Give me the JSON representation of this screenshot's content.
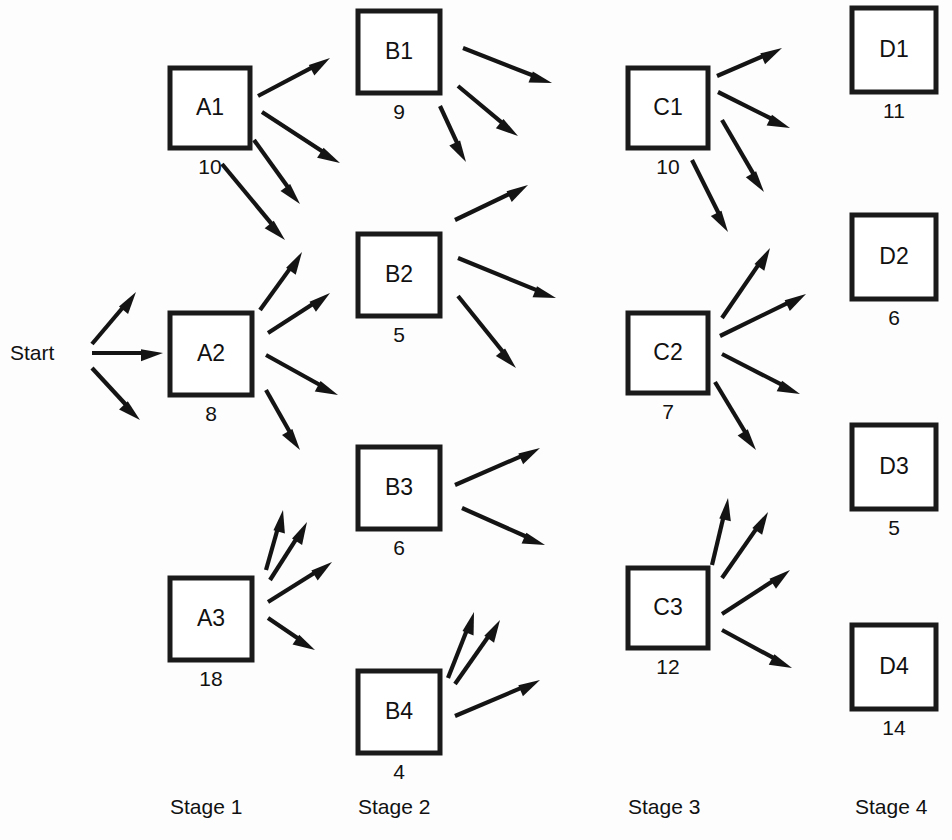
{
  "diagram": {
    "start_label": "Start",
    "stages": [
      {
        "id": "stage1",
        "label": "Stage 1",
        "label_x": 170,
        "label_y": 814
      },
      {
        "id": "stage2",
        "label": "Stage 2",
        "label_x": 358,
        "label_y": 814
      },
      {
        "id": "stage3",
        "label": "Stage 3",
        "label_x": 628,
        "label_y": 814
      },
      {
        "id": "stage4",
        "label": "Stage 4",
        "label_x": 855,
        "label_y": 814
      }
    ],
    "nodes": [
      {
        "id": "A1",
        "label": "A1",
        "value": "10",
        "stage": "Stage 1",
        "x": 170,
        "y": 68,
        "w": 80,
        "h": 80
      },
      {
        "id": "A2",
        "label": "A2",
        "value": "8",
        "stage": "Stage 1",
        "x": 170,
        "y": 313,
        "w": 82,
        "h": 82
      },
      {
        "id": "A3",
        "label": "A3",
        "value": "18",
        "stage": "Stage 1",
        "x": 170,
        "y": 578,
        "w": 82,
        "h": 82
      },
      {
        "id": "B1",
        "label": "B1",
        "value": "9",
        "stage": "Stage 2",
        "x": 358,
        "y": 11,
        "w": 82,
        "h": 82
      },
      {
        "id": "B2",
        "label": "B2",
        "value": "5",
        "stage": "Stage 2",
        "x": 358,
        "y": 234,
        "w": 82,
        "h": 82
      },
      {
        "id": "B3",
        "label": "B3",
        "value": "6",
        "stage": "Stage 2",
        "x": 358,
        "y": 447,
        "w": 82,
        "h": 82
      },
      {
        "id": "B4",
        "label": "B4",
        "value": "4",
        "stage": "Stage 2",
        "x": 358,
        "y": 671,
        "w": 82,
        "h": 82
      },
      {
        "id": "C1",
        "label": "C1",
        "value": "10",
        "stage": "Stage 3",
        "x": 628,
        "y": 68,
        "w": 80,
        "h": 80
      },
      {
        "id": "C2",
        "label": "C2",
        "value": "7",
        "stage": "Stage 3",
        "x": 628,
        "y": 313,
        "w": 80,
        "h": 80
      },
      {
        "id": "C3",
        "label": "C3",
        "value": "12",
        "stage": "Stage 3",
        "x": 628,
        "y": 568,
        "w": 80,
        "h": 80
      },
      {
        "id": "D1",
        "label": "D1",
        "value": "11",
        "stage": "Stage 4",
        "x": 852,
        "y": 8,
        "w": 84,
        "h": 84
      },
      {
        "id": "D2",
        "label": "D2",
        "value": "6",
        "stage": "Stage 4",
        "x": 852,
        "y": 215,
        "w": 84,
        "h": 84
      },
      {
        "id": "D3",
        "label": "D3",
        "value": "5",
        "stage": "Stage 4",
        "x": 852,
        "y": 425,
        "w": 84,
        "h": 84
      },
      {
        "id": "D4",
        "label": "D4",
        "value": "14",
        "stage": "Stage 4",
        "x": 852,
        "y": 625,
        "w": 84,
        "h": 84
      }
    ],
    "edges": [
      {
        "from": "Start",
        "to": "A1",
        "x1": 92,
        "y1": 344,
        "x2": 136,
        "y2": 292
      },
      {
        "from": "Start",
        "to": "A2",
        "x1": 92,
        "y1": 353,
        "x2": 163,
        "y2": 353
      },
      {
        "from": "Start",
        "to": "A3",
        "x1": 92,
        "y1": 368,
        "x2": 140,
        "y2": 420
      },
      {
        "from": "A1",
        "to": "B1",
        "x1": 258,
        "y1": 96,
        "x2": 330,
        "y2": 58
      },
      {
        "from": "A1",
        "to": "B2",
        "x1": 262,
        "y1": 112,
        "x2": 340,
        "y2": 163
      },
      {
        "from": "A1",
        "to": "B3",
        "x1": 254,
        "y1": 140,
        "x2": 300,
        "y2": 204
      },
      {
        "from": "A1",
        "to": "B4",
        "x1": 222,
        "y1": 164,
        "x2": 285,
        "y2": 240
      },
      {
        "from": "A2",
        "to": "B1",
        "x1": 260,
        "y1": 310,
        "x2": 302,
        "y2": 252
      },
      {
        "from": "A2",
        "to": "B2",
        "x1": 268,
        "y1": 333,
        "x2": 330,
        "y2": 293
      },
      {
        "from": "A2",
        "to": "B3",
        "x1": 266,
        "y1": 355,
        "x2": 338,
        "y2": 395
      },
      {
        "from": "A2",
        "to": "B4",
        "x1": 266,
        "y1": 390,
        "x2": 300,
        "y2": 450
      },
      {
        "from": "A3",
        "to": "B1",
        "x1": 266,
        "y1": 570,
        "x2": 283,
        "y2": 510
      },
      {
        "from": "A3",
        "to": "B2",
        "x1": 270,
        "y1": 580,
        "x2": 307,
        "y2": 522
      },
      {
        "from": "A3",
        "to": "B3",
        "x1": 268,
        "y1": 602,
        "x2": 332,
        "y2": 562
      },
      {
        "from": "A3",
        "to": "B4",
        "x1": 268,
        "y1": 618,
        "x2": 315,
        "y2": 650
      },
      {
        "from": "B1",
        "to": "C1",
        "x1": 463,
        "y1": 48,
        "x2": 552,
        "y2": 83
      },
      {
        "from": "B1",
        "to": "C2",
        "x1": 458,
        "y1": 86,
        "x2": 518,
        "y2": 136
      },
      {
        "from": "B1",
        "to": "C3",
        "x1": 440,
        "y1": 106,
        "x2": 466,
        "y2": 162
      },
      {
        "from": "B2",
        "to": "C1",
        "x1": 455,
        "y1": 220,
        "x2": 528,
        "y2": 185
      },
      {
        "from": "B2",
        "to": "C2",
        "x1": 458,
        "y1": 258,
        "x2": 556,
        "y2": 298
      },
      {
        "from": "B2",
        "to": "C3",
        "x1": 458,
        "y1": 296,
        "x2": 516,
        "y2": 368
      },
      {
        "from": "B3",
        "to": "C1",
        "x1": 455,
        "y1": 485,
        "x2": 540,
        "y2": 448
      },
      {
        "from": "B3",
        "to": "C2",
        "x1": 462,
        "y1": 508,
        "x2": 545,
        "y2": 545
      },
      {
        "from": "B4",
        "to": "C1",
        "x1": 448,
        "y1": 678,
        "x2": 474,
        "y2": 612
      },
      {
        "from": "B4",
        "to": "C2",
        "x1": 455,
        "y1": 684,
        "x2": 500,
        "y2": 620
      },
      {
        "from": "B4",
        "to": "C3",
        "x1": 455,
        "y1": 716,
        "x2": 540,
        "y2": 680
      },
      {
        "from": "C1",
        "to": "D1",
        "x1": 717,
        "y1": 76,
        "x2": 782,
        "y2": 48
      },
      {
        "from": "C1",
        "to": "D2",
        "x1": 718,
        "y1": 92,
        "x2": 790,
        "y2": 128
      },
      {
        "from": "C1",
        "to": "D3",
        "x1": 722,
        "y1": 120,
        "x2": 764,
        "y2": 192
      },
      {
        "from": "C1",
        "to": "D4",
        "x1": 692,
        "y1": 160,
        "x2": 728,
        "y2": 232
      },
      {
        "from": "C2",
        "to": "D1",
        "x1": 722,
        "y1": 318,
        "x2": 770,
        "y2": 248
      },
      {
        "from": "C2",
        "to": "D2",
        "x1": 720,
        "y1": 336,
        "x2": 806,
        "y2": 294
      },
      {
        "from": "C2",
        "to": "D3",
        "x1": 722,
        "y1": 354,
        "x2": 800,
        "y2": 394
      },
      {
        "from": "C2",
        "to": "D4",
        "x1": 715,
        "y1": 382,
        "x2": 756,
        "y2": 450
      },
      {
        "from": "C3",
        "to": "D1",
        "x1": 712,
        "y1": 565,
        "x2": 728,
        "y2": 498
      },
      {
        "from": "C3",
        "to": "D2",
        "x1": 722,
        "y1": 578,
        "x2": 768,
        "y2": 512
      },
      {
        "from": "C3",
        "to": "D3",
        "x1": 722,
        "y1": 614,
        "x2": 790,
        "y2": 570
      },
      {
        "from": "C3",
        "to": "D4",
        "x1": 722,
        "y1": 630,
        "x2": 792,
        "y2": 668
      }
    ]
  }
}
